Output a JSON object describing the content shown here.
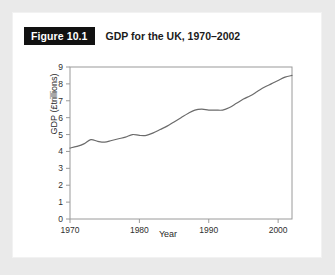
{
  "figure": {
    "badge": "Figure 10.1",
    "title": "GDP for the UK, 1970–2002"
  },
  "chart_data": {
    "type": "line",
    "title": "GDP for the UK, 1970–2002",
    "xlabel": "Year",
    "ylabel": "GDP (£trillions)",
    "xlim": [
      1970,
      2002
    ],
    "ylim": [
      0,
      9
    ],
    "xticks": [
      1970,
      1980,
      1990,
      2000
    ],
    "yticks": [
      0,
      1,
      2,
      3,
      4,
      5,
      6,
      7,
      8,
      9
    ],
    "grid": false,
    "legend": null,
    "line_color": "#6b6b6b",
    "series": [
      {
        "name": "GDP (£trillions)",
        "x": [
          1970,
          1971,
          1972,
          1973,
          1974,
          1975,
          1976,
          1977,
          1978,
          1979,
          1980,
          1981,
          1982,
          1983,
          1984,
          1985,
          1986,
          1987,
          1988,
          1989,
          1990,
          1991,
          1992,
          1993,
          1994,
          1995,
          1996,
          1997,
          1998,
          1999,
          2000,
          2001,
          2002
        ],
        "values": [
          4.2,
          4.3,
          4.45,
          4.7,
          4.6,
          4.55,
          4.65,
          4.75,
          4.85,
          5.0,
          4.95,
          4.95,
          5.1,
          5.3,
          5.5,
          5.75,
          6.0,
          6.25,
          6.45,
          6.5,
          6.45,
          6.45,
          6.45,
          6.6,
          6.85,
          7.1,
          7.3,
          7.55,
          7.8,
          8.0,
          8.2,
          8.4,
          8.5
        ]
      }
    ]
  },
  "axis": {
    "y_label": "GDP (£trillions)",
    "x_label": "Year",
    "y_ticks": [
      "0",
      "1",
      "2",
      "3",
      "4",
      "5",
      "6",
      "7",
      "8",
      "9"
    ],
    "x_ticks": [
      "1970",
      "1980",
      "1990",
      "2000"
    ]
  }
}
